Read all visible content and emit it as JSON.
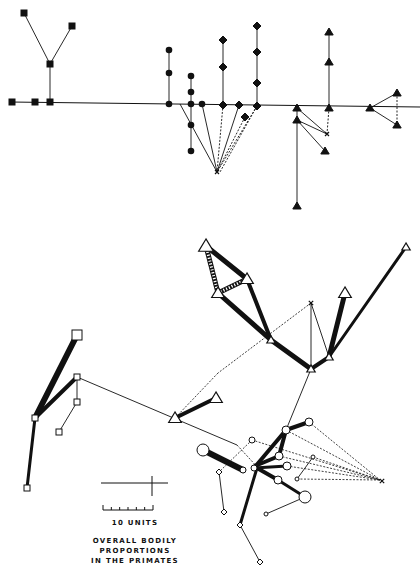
{
  "title": {
    "lines": [
      "OVERALL BODILY",
      "PROPORTIONS",
      "IN THE PRIMATES"
    ]
  },
  "scale": {
    "label": "10 UNITS",
    "ticks": 6
  },
  "colors": {
    "ink": "#111111",
    "paper": "#ffffff"
  },
  "top_diagram": {
    "baseline": {
      "x1": 10,
      "y1": 102,
      "x2": 420,
      "y2": 107
    },
    "lines": [
      [
        50,
        102,
        50,
        64
      ],
      [
        50,
        64,
        24,
        13
      ],
      [
        50,
        64,
        72,
        26
      ],
      [
        169,
        104,
        169,
        50
      ],
      [
        191,
        104,
        191,
        76
      ],
      [
        191,
        104,
        191,
        151
      ],
      [
        223,
        105,
        223,
        40
      ],
      [
        257,
        106,
        257,
        26
      ],
      [
        297,
        108,
        297,
        206
      ],
      [
        297,
        108,
        327,
        134
      ],
      [
        297,
        120,
        327,
        134
      ],
      [
        297,
        120,
        325,
        151
      ],
      [
        329,
        108,
        329,
        32
      ],
      [
        370,
        108,
        397,
        93
      ],
      [
        370,
        108,
        397,
        125
      ],
      [
        202,
        104,
        217,
        172
      ],
      [
        180,
        104,
        217,
        172
      ],
      [
        239,
        105,
        217,
        172
      ]
    ],
    "dashed": [
      [
        223,
        105,
        217,
        172
      ],
      [
        257,
        106,
        217,
        172
      ],
      [
        245,
        117,
        217,
        172
      ],
      [
        257,
        106,
        220,
        172
      ],
      [
        329,
        108,
        327,
        134
      ],
      [
        397,
        93,
        397,
        125
      ]
    ],
    "squares": [
      [
        12,
        102
      ],
      [
        35,
        102
      ],
      [
        50,
        102
      ],
      [
        50,
        64
      ],
      [
        24,
        13
      ],
      [
        72,
        26
      ]
    ],
    "circles": [
      [
        169,
        104
      ],
      [
        169,
        73
      ],
      [
        169,
        50
      ],
      [
        191,
        104
      ],
      [
        191,
        92
      ],
      [
        191,
        76
      ],
      [
        191,
        125
      ],
      [
        191,
        151
      ],
      [
        202,
        104
      ]
    ],
    "diamonds": [
      [
        223,
        105
      ],
      [
        223,
        67
      ],
      [
        223,
        40
      ],
      [
        239,
        105
      ],
      [
        257,
        106
      ],
      [
        257,
        83
      ],
      [
        257,
        52
      ],
      [
        257,
        26
      ],
      [
        245,
        117
      ]
    ],
    "triangles": [
      [
        297,
        108
      ],
      [
        297,
        120
      ],
      [
        329,
        108
      ],
      [
        329,
        62
      ],
      [
        329,
        32
      ],
      [
        370,
        108
      ],
      [
        397,
        93
      ],
      [
        397,
        125
      ],
      [
        325,
        151
      ],
      [
        297,
        206
      ]
    ],
    "crosses": [
      [
        217,
        172
      ],
      [
        327,
        134
      ]
    ]
  },
  "bottom_diagram": {
    "thick": [
      [
        206,
        246,
        247,
        279,
        5
      ],
      [
        247,
        279,
        271,
        340,
        4
      ],
      [
        218,
        293,
        271,
        340,
        5
      ],
      [
        271,
        340,
        311,
        369,
        5
      ],
      [
        311,
        369,
        329,
        357,
        4
      ],
      [
        329,
        357,
        345,
        293,
        5
      ],
      [
        329,
        357,
        406,
        247,
        3
      ],
      [
        175,
        418,
        216,
        398,
        4
      ],
      [
        77,
        335,
        35,
        418,
        6
      ],
      [
        77,
        377,
        35,
        418,
        4
      ],
      [
        35,
        418,
        27,
        488,
        3
      ],
      [
        203,
        450,
        243,
        470,
        6
      ],
      [
        254,
        468,
        286,
        430,
        4
      ],
      [
        286,
        430,
        309,
        422,
        4
      ],
      [
        286,
        430,
        279,
        456,
        4
      ],
      [
        279,
        456,
        255,
        466,
        4
      ],
      [
        254,
        468,
        287,
        466,
        3
      ],
      [
        257,
        468,
        278,
        480,
        4
      ],
      [
        278,
        480,
        305,
        497,
        3
      ],
      [
        257,
        468,
        240,
        525,
        3
      ]
    ],
    "hatched": [
      [
        206,
        246,
        218,
        293
      ],
      [
        218,
        293,
        247,
        279
      ]
    ],
    "lines": [
      [
        77,
        377,
        237,
        445
      ],
      [
        77,
        377,
        77,
        402
      ],
      [
        77,
        402,
        59,
        432
      ],
      [
        311,
        369,
        286,
        430
      ],
      [
        311,
        303,
        311,
        369
      ],
      [
        311,
        303,
        329,
        357
      ],
      [
        240,
        525,
        260,
        562
      ],
      [
        219,
        472,
        224,
        512
      ],
      [
        305,
        497,
        266,
        514
      ],
      [
        313,
        457,
        297,
        479
      ]
    ],
    "dashed": [
      [
        311,
        303,
        218,
        373
      ],
      [
        218,
        373,
        175,
        418
      ],
      [
        237,
        445,
        260,
        470
      ],
      [
        309,
        422,
        380,
        480
      ],
      [
        286,
        430,
        380,
        480
      ],
      [
        252,
        440,
        380,
        480
      ],
      [
        279,
        456,
        380,
        480
      ],
      [
        313,
        457,
        380,
        480
      ],
      [
        287,
        466,
        380,
        480
      ],
      [
        297,
        479,
        380,
        480
      ],
      [
        252,
        440,
        219,
        472
      ]
    ],
    "triangles_open": [
      [
        206,
        246,
        7
      ],
      [
        247,
        279,
        6
      ],
      [
        218,
        293,
        6
      ],
      [
        271,
        340,
        4
      ],
      [
        311,
        369,
        4
      ],
      [
        329,
        357,
        4
      ],
      [
        345,
        293,
        6
      ],
      [
        406,
        247,
        4
      ],
      [
        216,
        398,
        6
      ],
      [
        175,
        418,
        6
      ]
    ],
    "squares_open": [
      [
        77,
        335,
        5
      ],
      [
        77,
        377,
        3
      ],
      [
        77,
        402,
        3
      ],
      [
        59,
        432,
        3
      ],
      [
        35,
        418,
        3
      ],
      [
        27,
        488,
        3
      ]
    ],
    "circles_open": [
      [
        203,
        450,
        6
      ],
      [
        243,
        470,
        3
      ],
      [
        254,
        468,
        3
      ],
      [
        286,
        430,
        4
      ],
      [
        309,
        422,
        4
      ],
      [
        252,
        440,
        3
      ],
      [
        279,
        456,
        4
      ],
      [
        287,
        466,
        4
      ],
      [
        278,
        480,
        4
      ],
      [
        305,
        497,
        6
      ],
      [
        266,
        514,
        2
      ],
      [
        313,
        457,
        2
      ],
      [
        297,
        479,
        2
      ]
    ],
    "diamonds_open": [
      [
        219,
        472,
        3
      ],
      [
        224,
        512,
        3
      ],
      [
        240,
        525,
        3
      ],
      [
        260,
        562,
        3
      ]
    ],
    "crosses": [
      [
        311,
        303
      ],
      [
        382,
        481
      ]
    ]
  }
}
